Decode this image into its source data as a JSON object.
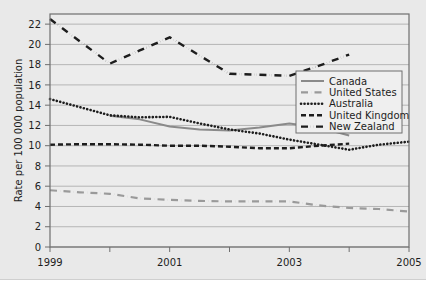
{
  "chart_data": {
    "type": "line",
    "title": "",
    "xlabel": "",
    "ylabel": "Rate per 100 000 population",
    "xlim": [
      1999,
      2005
    ],
    "ylim": [
      0,
      23
    ],
    "yticks": [
      0,
      2,
      4,
      6,
      8,
      10,
      12,
      14,
      16,
      18,
      20,
      22
    ],
    "ytick_labels": [
      "0",
      "2",
      "4",
      "6",
      "8",
      "10",
      "12",
      "14",
      "16",
      "18",
      "20",
      "22"
    ],
    "xticks": [
      1999,
      2000,
      2001,
      2002,
      2003,
      2004,
      2005
    ],
    "xtick_labels": [
      "1999",
      "",
      "2001",
      "",
      "2003",
      "",
      "2005"
    ],
    "xtick_labels_shown": [
      "1999",
      "2001",
      "2003",
      "2005"
    ],
    "grid": "horizontal",
    "legend_position": "right-upper",
    "series": [
      {
        "name": "Canada",
        "style": "solid",
        "color": "#8a8a8a",
        "x": [
          2000.0,
          2000.5,
          2001.0,
          2001.5,
          2002.0,
          2002.5,
          2003.0,
          2003.5,
          2004.0
        ],
        "values": [
          12.95,
          12.6,
          11.9,
          11.6,
          11.5,
          11.8,
          12.2,
          11.8,
          11.0
        ]
      },
      {
        "name": "United States",
        "style": "dash-dot",
        "color": "#9a9a9a",
        "x": [
          1999,
          1999.5,
          2000,
          2000.5,
          2001,
          2001.5,
          2002,
          2002.5,
          2003,
          2003.5,
          2004,
          2004.5,
          2005
        ],
        "values": [
          5.6,
          5.4,
          5.25,
          4.8,
          4.65,
          4.55,
          4.5,
          4.5,
          4.5,
          4.1,
          3.85,
          3.75,
          3.5
        ]
      },
      {
        "name": "Australia",
        "style": "dotted",
        "color": "#1d1d1d",
        "x": [
          1999,
          1999.5,
          2000,
          2000.5,
          2001,
          2001.5,
          2002,
          2002.5,
          2003,
          2003.5,
          2004,
          2004.5,
          2005
        ],
        "values": [
          14.6,
          13.8,
          13.0,
          12.8,
          12.85,
          12.2,
          11.6,
          11.2,
          10.6,
          10.1,
          9.6,
          10.1,
          10.4
        ]
      },
      {
        "name": "United Kingdom",
        "style": "dashed",
        "color": "#1d1d1d",
        "x": [
          1999,
          1999.5,
          2000,
          2000.5,
          2001,
          2001.5,
          2002,
          2002.5,
          2003,
          2003.5,
          2004
        ],
        "values": [
          10.1,
          10.15,
          10.15,
          10.1,
          10.0,
          10.0,
          9.9,
          9.75,
          9.75,
          10.0,
          10.2
        ]
      },
      {
        "name": "New Zealand",
        "style": "dash-dot-dot",
        "color": "#1d1d1d",
        "x": [
          1999,
          1999.5,
          2000,
          2000.5,
          2001,
          2001.5,
          2002,
          2002.5,
          2003,
          2003.5,
          2004
        ],
        "values": [
          22.5,
          20.3,
          18.1,
          19.4,
          20.7,
          18.9,
          17.1,
          17.0,
          16.9,
          17.9,
          19.0
        ]
      }
    ],
    "legend": [
      {
        "label": "Canada",
        "style": "solid",
        "color": "#8a8a8a"
      },
      {
        "label": "United States",
        "style": "dash-dot",
        "color": "#9a9a9a"
      },
      {
        "label": "Australia",
        "style": "dotted",
        "color": "#1d1d1d"
      },
      {
        "label": "United Kingdom",
        "style": "dashed",
        "color": "#1d1d1d"
      },
      {
        "label": "New Zealand",
        "style": "dash-dot-dot",
        "color": "#1d1d1d"
      }
    ],
    "colors": {
      "page_background": "#e9e9e9",
      "plot_background": "#ececec",
      "grid": "#b5b5b5",
      "frame": "#6f6f6f",
      "text": "#1d1d1d"
    }
  }
}
